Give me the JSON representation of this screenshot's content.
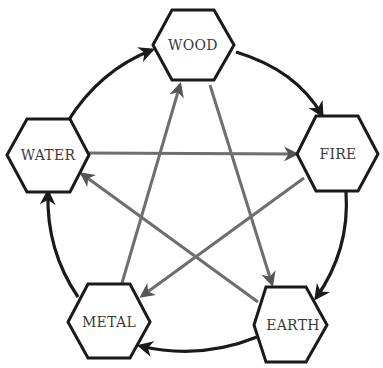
{
  "diagram": {
    "colors": {
      "generating_cycle": "#1a1a1a",
      "controlling_cycle": "#6e6e6e",
      "hexagon_stroke": "#1a1a1a",
      "hexagon_fill": "#ffffff",
      "text": "#3a3a3a"
    },
    "nodes": [
      {
        "id": "wood",
        "label": "WOOD"
      },
      {
        "id": "fire",
        "label": "FIRE"
      },
      {
        "id": "earth",
        "label": "EARTH"
      },
      {
        "id": "metal",
        "label": "METAL"
      },
      {
        "id": "water",
        "label": "WATER"
      }
    ],
    "generating_edges": [
      {
        "from": "wood",
        "to": "fire"
      },
      {
        "from": "fire",
        "to": "earth"
      },
      {
        "from": "earth",
        "to": "metal"
      },
      {
        "from": "metal",
        "to": "water"
      },
      {
        "from": "water",
        "to": "wood"
      }
    ],
    "controlling_edges": [
      {
        "from": "wood",
        "to": "earth"
      },
      {
        "from": "earth",
        "to": "water"
      },
      {
        "from": "water",
        "to": "fire"
      },
      {
        "from": "fire",
        "to": "metal"
      },
      {
        "from": "metal",
        "to": "wood"
      }
    ]
  }
}
